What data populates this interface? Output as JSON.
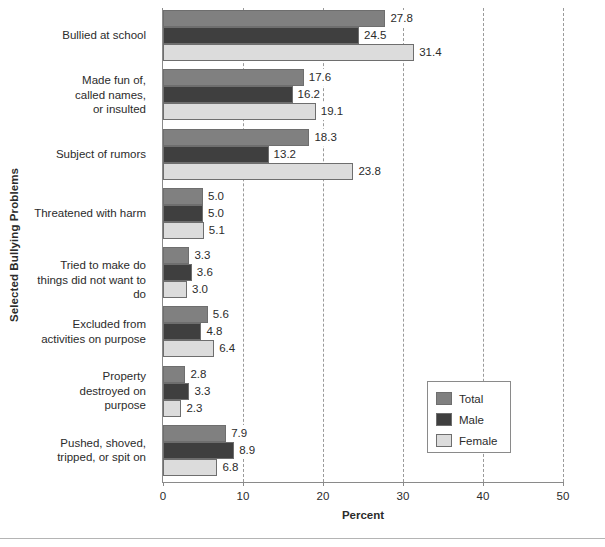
{
  "chart_data": {
    "type": "bar",
    "orientation": "horizontal",
    "title": "",
    "xlabel": "Percent",
    "ylabel": "Selected Bullying Problems",
    "xlim": [
      0,
      50
    ],
    "xticks": [
      "0",
      "10",
      "20",
      "30",
      "40",
      "50"
    ],
    "grid": "vertical-dashed",
    "legend_position": "inside-right",
    "categories": [
      "Bullied at school",
      "Made fun of,\ncalled names,\nor insulted",
      "Subject of rumors",
      "Threatened with harm",
      "Tried to make do\nthings did not want to do",
      "Excluded from\nactivities on purpose",
      "Property\ndestroyed on\npurpose",
      "Pushed, shoved,\ntripped, or spit on"
    ],
    "series": [
      {
        "name": "Total",
        "color": "#808080",
        "values": [
          27.8,
          17.6,
          18.3,
          5.0,
          3.3,
          5.6,
          2.8,
          7.9
        ],
        "labels": [
          "27.8",
          "17.6",
          "18.3",
          "5.0",
          "3.3",
          "5.6",
          "2.8",
          "7.9"
        ]
      },
      {
        "name": "Male",
        "color": "#3f3f3f",
        "values": [
          24.5,
          16.2,
          13.2,
          5.0,
          3.6,
          4.8,
          3.3,
          8.9
        ],
        "labels": [
          "24.5",
          "16.2",
          "13.2",
          "5.0",
          "3.6",
          "4.8",
          "3.3",
          "8.9"
        ]
      },
      {
        "name": "Female",
        "color": "#dcdcdc",
        "values": [
          31.4,
          19.1,
          23.8,
          5.1,
          3.0,
          6.4,
          2.3,
          6.8
        ],
        "labels": [
          "31.4",
          "19.1",
          "23.8",
          "5.1",
          "3.0",
          "6.4",
          "2.3",
          "6.8"
        ]
      }
    ]
  },
  "legend": {
    "items": [
      {
        "label": "Total",
        "key": "total"
      },
      {
        "label": "Male",
        "key": "male"
      },
      {
        "label": "Female",
        "key": "female"
      }
    ]
  },
  "axis": {
    "x_title": "Percent",
    "y_title": "Selected Bullying Problems",
    "x_ticks": [
      "0",
      "10",
      "20",
      "30",
      "40",
      "50"
    ]
  }
}
